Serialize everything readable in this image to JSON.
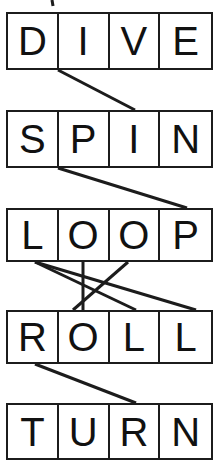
{
  "puzzle": {
    "title": "Word Letter Matching Puzzle",
    "type": "letter-grid-matching",
    "background_color": "#ffffff",
    "line_color": "#1c1c1c",
    "text_color": "#111111",
    "grid": {
      "left": 6,
      "right": 213,
      "cells_per_word": 4,
      "border_width": 2
    },
    "words": [
      {
        "id": "word-dive",
        "text": "DIVE",
        "letters": [
          "D",
          "I",
          "V",
          "E"
        ],
        "top": 12,
        "height": 58,
        "font_size": 40
      },
      {
        "id": "word-spin",
        "text": "SPIN",
        "letters": [
          "S",
          "P",
          "I",
          "N"
        ],
        "top": 110,
        "height": 58,
        "font_size": 40
      },
      {
        "id": "word-loop",
        "text": "LOOP",
        "letters": [
          "L",
          "O",
          "O",
          "P"
        ],
        "top": 208,
        "height": 54,
        "font_size": 40
      },
      {
        "id": "word-roll",
        "text": "ROLL",
        "letters": [
          "R",
          "O",
          "L",
          "L"
        ],
        "top": 310,
        "height": 54,
        "font_size": 40
      },
      {
        "id": "word-turn",
        "text": "TURN",
        "letters": [
          "T",
          "U",
          "R",
          "N"
        ],
        "top": 403,
        "height": 57,
        "font_size": 40
      }
    ],
    "connectors": [
      {
        "id": "connector-dive-i-to-spin-i",
        "from_word": "DIVE",
        "from_letter": "I",
        "from_cell_index": 1,
        "to_word": "SPIN",
        "to_letter": "I",
        "to_cell_index": 2,
        "x1": 58,
        "y1": 70,
        "x2": 135,
        "y2": 110,
        "stroke_width": 3
      },
      {
        "id": "connector-spin-p-to-loop-p",
        "from_word": "SPIN",
        "from_letter": "P",
        "from_cell_index": 1,
        "to_word": "LOOP",
        "to_letter": "P",
        "to_cell_index": 3,
        "x1": 58,
        "y1": 168,
        "x2": 187,
        "y2": 208,
        "stroke_width": 3
      },
      {
        "id": "connector-loop-l-to-roll-l3",
        "from_word": "LOOP",
        "from_letter": "L",
        "from_cell_index": 0,
        "to_word": "ROLL",
        "to_letter": "L",
        "to_cell_index": 2,
        "x1": 35,
        "y1": 262,
        "x2": 136,
        "y2": 310,
        "stroke_width": 3
      },
      {
        "id": "connector-loop-l-to-roll-l4",
        "from_word": "LOOP",
        "from_letter": "L",
        "from_cell_index": 0,
        "to_word": "ROLL",
        "to_letter": "L",
        "to_cell_index": 3,
        "x1": 35,
        "y1": 262,
        "x2": 196,
        "y2": 310,
        "stroke_width": 3
      },
      {
        "id": "connector-loop-o2-to-roll-o",
        "from_word": "LOOP",
        "from_letter": "O",
        "from_cell_index": 1,
        "to_word": "ROLL",
        "to_letter": "O",
        "to_cell_index": 1,
        "x1": 83,
        "y1": 262,
        "x2": 83,
        "y2": 310,
        "stroke_width": 3
      },
      {
        "id": "connector-loop-o3-to-roll-r",
        "from_word": "LOOP",
        "from_letter": "O",
        "from_cell_index": 2,
        "to_word": "ROLL",
        "to_letter": "R",
        "to_cell_index": 0,
        "x1": 128,
        "y1": 262,
        "x2": 73,
        "y2": 310,
        "stroke_width": 3
      },
      {
        "id": "connector-roll-r-to-turn-r",
        "from_word": "ROLL",
        "from_letter": "R",
        "from_cell_index": 0,
        "to_word": "TURN",
        "to_letter": "R",
        "to_cell_index": 2,
        "x1": 35,
        "y1": 364,
        "x2": 136,
        "y2": 403,
        "stroke_width": 3
      },
      {
        "id": "connector-stub-top-cropped",
        "from_word": null,
        "from_letter": null,
        "to_word": "DIVE",
        "to_letter": "I",
        "to_cell_index": 1,
        "x1": 52,
        "y1": 0,
        "x2": 53,
        "y2": 6,
        "stroke_width": 3
      }
    ]
  }
}
